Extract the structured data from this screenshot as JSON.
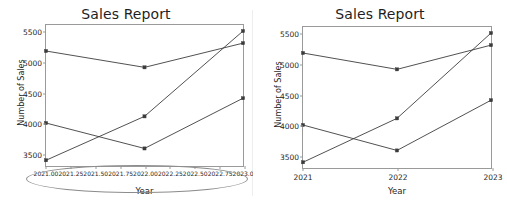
{
  "figures": [
    {
      "name": "left",
      "title": "Sales Report",
      "xlabel": "Year",
      "ylabel": "Number of Sales",
      "xticks": [
        "2021.00",
        "2021.25",
        "2021.50",
        "2021.75",
        "2022.00",
        "2022.25",
        "2022.50",
        "2022.75",
        "2023.00"
      ],
      "yticks": [
        "3500",
        "4000",
        "4500",
        "5000",
        "5500"
      ],
      "annotation": "crowded-xtick-labels-highlight"
    },
    {
      "name": "right",
      "title": "Sales Report",
      "xlabel": "Year",
      "ylabel": "Number of Sales",
      "xticks": [
        "2021",
        "2022",
        "2023"
      ],
      "yticks": [
        "3500",
        "4000",
        "4500",
        "5000",
        "5500"
      ]
    }
  ],
  "chart_data": [
    {
      "type": "line",
      "title": "Sales Report",
      "xlabel": "Year",
      "ylabel": "Number of Sales",
      "x": [
        2021,
        2022,
        2023
      ],
      "xlim": [
        2021.0,
        2023.0
      ],
      "ylim": [
        3290,
        5620
      ],
      "xtick_values": [
        2021.0,
        2021.25,
        2021.5,
        2021.75,
        2022.0,
        2022.25,
        2022.5,
        2022.75,
        2023.0
      ],
      "xtick_labels": [
        "2021.00",
        "2021.25",
        "2021.50",
        "2021.75",
        "2022.00",
        "2022.25",
        "2022.50",
        "2022.75",
        "2023.00"
      ],
      "ytick_values": [
        3500,
        4000,
        4500,
        5000,
        5500
      ],
      "grid": false,
      "legend": "none",
      "marker": "square",
      "line_color": "#3b3b3b",
      "series": [
        {
          "name": "series-1",
          "values": [
            5190,
            4920,
            5320
          ]
        },
        {
          "name": "series-2",
          "values": [
            4000,
            3580,
            4410
          ]
        },
        {
          "name": "series-3",
          "values": [
            3385,
            4110,
            5520
          ]
        }
      ]
    },
    {
      "type": "line",
      "title": "Sales Report",
      "xlabel": "Year",
      "ylabel": "Number of Sales",
      "x": [
        2021,
        2022,
        2023
      ],
      "xlim": [
        2021.0,
        2023.0
      ],
      "ylim": [
        3290,
        5620
      ],
      "xtick_values": [
        2021,
        2022,
        2023
      ],
      "xtick_labels": [
        "2021",
        "2022",
        "2023"
      ],
      "ytick_values": [
        3500,
        4000,
        4500,
        5000,
        5500
      ],
      "grid": false,
      "legend": "none",
      "marker": "square",
      "line_color": "#3b3b3b",
      "series": [
        {
          "name": "series-1",
          "values": [
            5190,
            4920,
            5320
          ]
        },
        {
          "name": "series-2",
          "values": [
            4000,
            3580,
            4410
          ]
        },
        {
          "name": "series-3",
          "values": [
            3385,
            4110,
            5520
          ]
        }
      ]
    }
  ]
}
